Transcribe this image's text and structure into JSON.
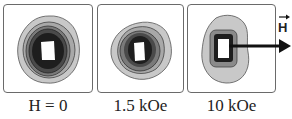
{
  "figure": {
    "panels": [
      {
        "id": "p1",
        "label": "H = 0"
      },
      {
        "id": "p2",
        "label": "1.5 kOe"
      },
      {
        "id": "p3",
        "label": "10 kOe"
      }
    ],
    "field_arrow_label": "H",
    "colors": {
      "border": "#6a6a6a",
      "level1": "#c8c8c8",
      "level2": "#a8a8a8",
      "level3": "#7a7a7a",
      "level4": "#4a4a4a",
      "level5": "#1e1e1e",
      "core": "#ffffff"
    }
  }
}
